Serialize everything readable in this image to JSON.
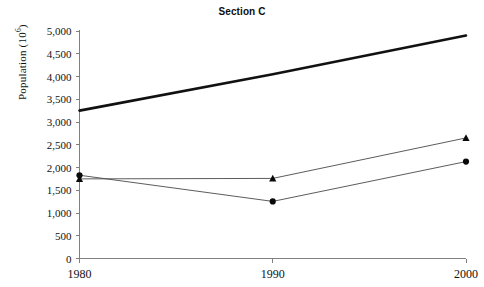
{
  "chart_data": {
    "type": "line",
    "title": "Section C",
    "xlabel": "",
    "ylabel": "Population (10",
    "ylabel_sup": "6",
    "ylabel_suffix": ")",
    "x": [
      1980,
      1990,
      2000
    ],
    "xtick_labels": [
      "1980",
      "1990",
      "2000"
    ],
    "ytick_labels": [
      "0",
      "500",
      "1,000",
      "1,500",
      "2,000",
      "2,500",
      "3,000",
      "3,500",
      "4,000",
      "4,500",
      "5,000"
    ],
    "ytick_values": [
      0,
      500,
      1000,
      1500,
      2000,
      2500,
      3000,
      3500,
      4000,
      4500,
      5000
    ],
    "ylim": [
      0,
      5000
    ],
    "xlim": [
      1980,
      2000
    ],
    "grid": false,
    "legend": "none",
    "series": [
      {
        "name": "thick-trend-line",
        "marker": "none",
        "line_width": "thick",
        "color": "#111111",
        "values": [
          3250,
          4050,
          4900
        ]
      },
      {
        "name": "triangle-series",
        "marker": "triangle",
        "line_width": "thin",
        "color": "#0a0a0a",
        "values": [
          1750,
          1760,
          2650
        ]
      },
      {
        "name": "circle-series",
        "marker": "circle",
        "line_width": "thin",
        "color": "#0a0a0a",
        "values": [
          1830,
          1255,
          2130
        ]
      }
    ]
  }
}
